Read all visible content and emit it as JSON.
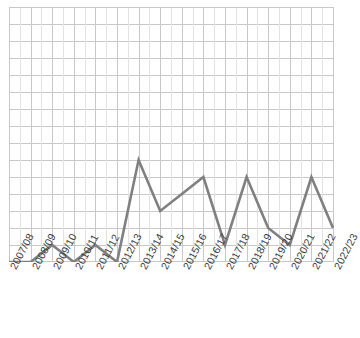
{
  "chart_data": {
    "type": "line",
    "title": "",
    "subtitle": "",
    "xlabel": "",
    "ylabel": "",
    "categories": [
      "2007/08",
      "2008/09",
      "2009/10",
      "2010/11",
      "2011/12",
      "2012/13",
      "2013/14",
      "2014/15",
      "2015/16",
      "2016/17",
      "2017/18",
      "2018/19",
      "2019/20",
      "2020/21",
      "2021/22",
      "2022/23"
    ],
    "series": [
      {
        "name": "",
        "color": "#808080",
        "values": [
          0,
          0,
          1,
          0,
          1,
          0,
          6,
          3,
          4,
          5,
          1,
          5,
          2,
          1,
          5,
          2
        ]
      }
    ],
    "ylim": [
      0,
      15
    ],
    "xlim": [
      0,
      15
    ],
    "y_gridline_step": 1,
    "y_tick_labels": [],
    "grid": true,
    "grid_color": "#c8c8c8",
    "grid_minor_color": "#e0e0e0",
    "legend": false,
    "legend_position": "none",
    "annotations": [],
    "axis_label_rotation": -62,
    "plot_background": "#ffffff"
  },
  "axis": {
    "x_tick_labels": [
      "2007/08",
      "2008/09",
      "2009/10",
      "2010/11",
      "2011/12",
      "2012/13",
      "2013/14",
      "2014/15",
      "2015/16",
      "2016/17",
      "2017/18",
      "2018/19",
      "2019/20",
      "2020/21",
      "2021/22",
      "2022/23"
    ]
  },
  "colors": {
    "series_line": "#808080",
    "grid_major": "#c8c8c8",
    "grid_minor": "#e2e2e2",
    "plot_border": "#c8c8c8",
    "tick_text": "#3b3b3b",
    "background": "#ffffff"
  }
}
